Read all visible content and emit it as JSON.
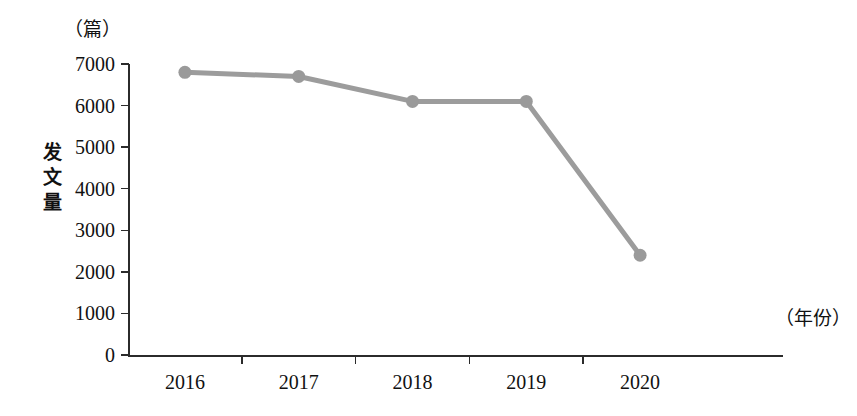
{
  "chart_data": {
    "type": "line",
    "title": "",
    "subtitle": "",
    "xlabel": "（年份）",
    "ylabel": "发文量",
    "yunit": "（篇）",
    "categories": [
      "2016",
      "2017",
      "2018",
      "2019",
      "2020"
    ],
    "values": [
      6800,
      6700,
      6100,
      6100,
      2400
    ],
    "series": [
      {
        "name": "发文量",
        "values": [
          6800,
          6700,
          6100,
          6100,
          2400
        ]
      }
    ],
    "ylim": [
      0,
      7000
    ],
    "yticks": [
      0,
      1000,
      2000,
      3000,
      4000,
      5000,
      6000,
      7000
    ],
    "ytick_labels": [
      "0",
      "1000",
      "2000",
      "3000",
      "4000",
      "5000",
      "6000",
      "7000"
    ],
    "grid": false,
    "legend": "none",
    "marker": "circle",
    "colors": {
      "line": "#9c9c9c",
      "marker": "#9a9a9a",
      "axis": "#2b2b2b",
      "text": "#111111",
      "background": "#ffffff"
    }
  },
  "y_axis_title_chars": [
    "发",
    "文",
    "量"
  ]
}
